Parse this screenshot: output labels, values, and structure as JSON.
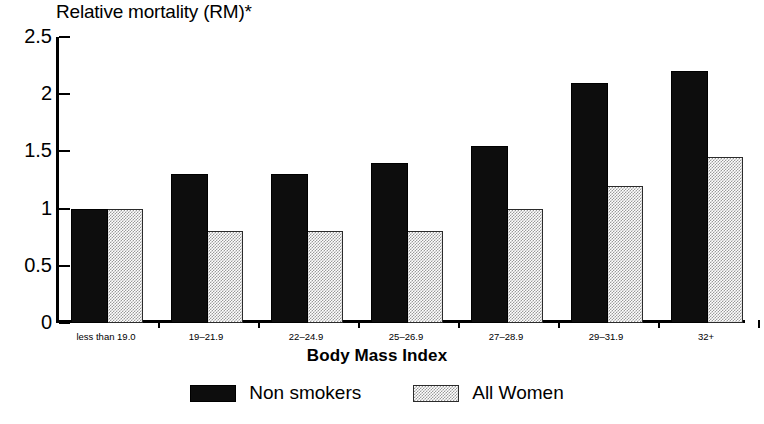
{
  "chart_data": {
    "type": "bar",
    "title": "",
    "ylabel": "Relative mortality (RM)*",
    "xlabel": "Body Mass Index",
    "ylim": [
      0,
      2.5
    ],
    "yticks": [
      0,
      0.5,
      1,
      1.5,
      2,
      2.5
    ],
    "ytick_labels": [
      "0",
      "0.5",
      "1",
      "1.5",
      "2",
      "2.5"
    ],
    "grid": false,
    "legend_position": "bottom",
    "categories": [
      "less than 19.0",
      "19–21.9",
      "22–24.9",
      "25–26.9",
      "27–28.9",
      "29–31.9",
      "32+"
    ],
    "series": [
      {
        "name": "Non smokers",
        "color": "#0d0d0d",
        "values": [
          1.0,
          1.3,
          1.3,
          1.4,
          1.55,
          2.1,
          2.2
        ]
      },
      {
        "name": "All Women",
        "color": "#bfbfbf",
        "values": [
          1.0,
          0.8,
          0.8,
          0.8,
          1.0,
          1.2,
          1.45
        ]
      }
    ]
  },
  "legend": {
    "items": [
      {
        "label": "Non smokers",
        "swatch": "dark"
      },
      {
        "label": "All Women",
        "swatch": "light"
      }
    ]
  }
}
